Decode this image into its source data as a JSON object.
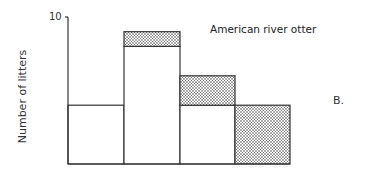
{
  "chart_data": {
    "type": "bar",
    "stacked": true,
    "title": "American river otter",
    "panel_label": "B.",
    "xlabel": "",
    "ylabel": "Number of litters",
    "ylim": [
      0,
      10
    ],
    "yticks": [
      10
    ],
    "grid": false,
    "categories": [
      "1",
      "2",
      "3",
      "4"
    ],
    "series": [
      {
        "name": "unshaded",
        "fill": "white",
        "values": [
          4,
          8,
          4,
          0
        ]
      },
      {
        "name": "shaded (stippled)",
        "fill": "dotted",
        "values": [
          0,
          1,
          2,
          4
        ]
      }
    ],
    "totals": [
      4,
      9,
      6,
      4
    ]
  },
  "labels": {
    "ylabel": "Number of litters",
    "ytick_top": "10",
    "title": "American river otter",
    "panel": "B."
  },
  "colors": {
    "stroke": "#333333",
    "stipple_dot": "#333333",
    "background": "#ffffff"
  }
}
